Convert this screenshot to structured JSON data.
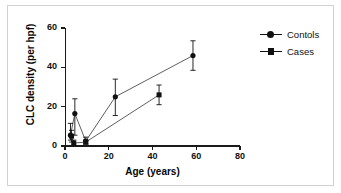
{
  "figure": {
    "background_color": "#ffffff",
    "frame_color": "#d2d2d2",
    "ink_color": "#111111"
  },
  "legend": {
    "position": "top-right",
    "entries": [
      {
        "label": "Contols",
        "marker": "circle-marker"
      },
      {
        "label": "Cases",
        "marker": "square-marker"
      }
    ]
  },
  "axes": {
    "x": {
      "label": "Age (years)",
      "ticks": [
        "0",
        "20",
        "40",
        "60",
        "80"
      ],
      "min": 0,
      "max": 80
    },
    "y": {
      "label": "CLC density (per hpf)",
      "ticks": [
        "0",
        "20",
        "40",
        "60"
      ],
      "min": 0,
      "max": 60
    }
  },
  "chart_data": {
    "type": "scatter",
    "title": "",
    "xlabel": "Age (years)",
    "ylabel": "CLC density (per hpf)",
    "xlim": [
      0,
      80
    ],
    "ylim": [
      0,
      60
    ],
    "xticks": [
      0,
      20,
      40,
      60,
      80
    ],
    "yticks": [
      0,
      20,
      40,
      60
    ],
    "grid": false,
    "legend_position": "top-right",
    "error_bars": "vertical",
    "connected": true,
    "series": [
      {
        "name": "Contols",
        "marker": "circle",
        "color": "#111111",
        "points": [
          {
            "x": 2.5,
            "y": 5.5,
            "yerr_low": 3.0,
            "yerr_high": 11.5
          },
          {
            "x": 4.5,
            "y": 16.5,
            "yerr_low": 5.5,
            "yerr_high": 24.0
          },
          {
            "x": 9.5,
            "y": 2.5,
            "yerr_low": 1.0,
            "yerr_high": 4.5
          },
          {
            "x": 23.0,
            "y": 25.0,
            "yerr_low": 15.5,
            "yerr_high": 34.0
          },
          {
            "x": 58.5,
            "y": 46.0,
            "yerr_low": 38.5,
            "yerr_high": 53.5
          }
        ]
      },
      {
        "name": "Cases",
        "marker": "square",
        "color": "#111111",
        "points": [
          {
            "x": 3.0,
            "y": 5.0,
            "yerr_low": 2.0,
            "yerr_high": 8.0
          },
          {
            "x": 4.0,
            "y": 1.5,
            "yerr_low": 0.5,
            "yerr_high": 3.0
          },
          {
            "x": 9.5,
            "y": 2.0,
            "yerr_low": 1.0,
            "yerr_high": 3.0
          },
          {
            "x": 43.0,
            "y": 26.0,
            "yerr_low": 21.0,
            "yerr_high": 31.0
          }
        ]
      }
    ]
  }
}
